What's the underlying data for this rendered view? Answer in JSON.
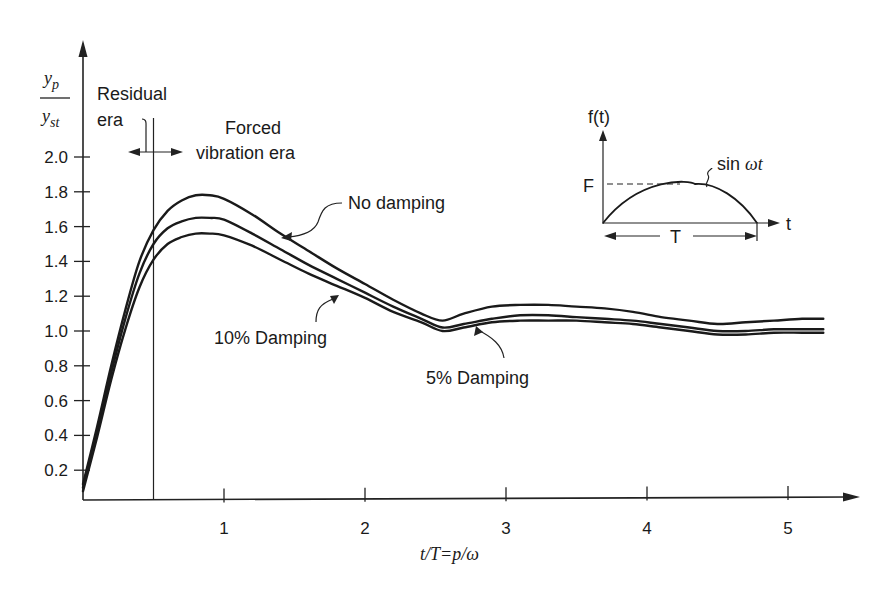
{
  "chart_data": {
    "type": "line",
    "title": "",
    "xlabel": "t/T = p/ω",
    "ylabel_numerator": "y_p",
    "ylabel_denominator": "y_st",
    "ylabel": "y_p / y_st",
    "x_ticks": [
      1,
      2,
      3,
      4,
      5
    ],
    "x_tick_labels": [
      "1",
      "2",
      "3",
      "4",
      "5"
    ],
    "y_ticks": [
      0.2,
      0.4,
      0.6,
      0.8,
      1.0,
      1.2,
      1.4,
      1.6,
      1.8,
      2.0
    ],
    "y_tick_labels": [
      "0.2",
      "0.4",
      "0.6",
      "0.8",
      "1.0",
      "1.2",
      "1.4",
      "1.6",
      "1.8",
      "2.0"
    ],
    "xlim": [
      0,
      5.3
    ],
    "ylim": [
      0,
      2.2
    ],
    "grid": false,
    "x": [
      0.0,
      0.1,
      0.2,
      0.3,
      0.4,
      0.5,
      0.6,
      0.7,
      0.8,
      0.9,
      1.0,
      1.2,
      1.4,
      1.6,
      1.8,
      2.0,
      2.2,
      2.4,
      2.55,
      2.7,
      2.9,
      3.1,
      3.3,
      3.5,
      3.7,
      3.9,
      4.1,
      4.3,
      4.5,
      4.7,
      4.9,
      5.1,
      5.25
    ],
    "series": [
      {
        "name": "No damping",
        "values": [
          0.12,
          0.45,
          0.8,
          1.12,
          1.4,
          1.58,
          1.69,
          1.75,
          1.78,
          1.78,
          1.76,
          1.67,
          1.56,
          1.46,
          1.36,
          1.27,
          1.18,
          1.1,
          1.06,
          1.1,
          1.14,
          1.15,
          1.15,
          1.14,
          1.13,
          1.11,
          1.08,
          1.06,
          1.04,
          1.05,
          1.06,
          1.07,
          1.07
        ]
      },
      {
        "name": "5% Damping",
        "values": [
          0.1,
          0.42,
          0.76,
          1.07,
          1.33,
          1.5,
          1.59,
          1.63,
          1.65,
          1.65,
          1.64,
          1.56,
          1.47,
          1.38,
          1.3,
          1.22,
          1.14,
          1.07,
          1.02,
          1.04,
          1.07,
          1.09,
          1.09,
          1.08,
          1.07,
          1.06,
          1.04,
          1.02,
          1.0,
          1.0,
          1.01,
          1.01,
          1.01
        ]
      },
      {
        "name": "10% Damping",
        "values": [
          0.08,
          0.39,
          0.72,
          1.01,
          1.25,
          1.41,
          1.5,
          1.54,
          1.56,
          1.56,
          1.55,
          1.49,
          1.41,
          1.33,
          1.26,
          1.19,
          1.11,
          1.05,
          1.0,
          1.02,
          1.05,
          1.06,
          1.06,
          1.06,
          1.05,
          1.04,
          1.02,
          1.0,
          0.98,
          0.98,
          0.99,
          0.99,
          0.99
        ]
      }
    ],
    "divider_x": 0.5,
    "annotations": {
      "residual_era": [
        "Residual",
        "era"
      ],
      "forced_era": [
        "Forced",
        "vibration era"
      ],
      "no_damping": "No damping",
      "ten_pct": "10% Damping",
      "five_pct": "5% Damping"
    },
    "inset": {
      "ylabel": "f(t)",
      "xlabel": "t",
      "peak_label": "F",
      "duration_label": "T",
      "curve_label_prefix": "sin ",
      "curve_label_italic": "ωt",
      "curve": "half-sine pulse"
    }
  }
}
